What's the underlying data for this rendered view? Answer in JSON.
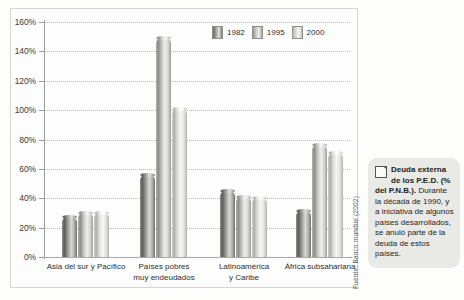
{
  "chart_data": {
    "type": "bar",
    "title": "",
    "xlabel": "",
    "ylabel": "",
    "ylim": [
      0,
      160
    ],
    "ytick_labels": [
      "0%",
      "20%",
      "40%",
      "60%",
      "80%",
      "100%",
      "120%",
      "140%",
      "160%"
    ],
    "ytick_values": [
      0,
      20,
      40,
      60,
      80,
      100,
      120,
      140,
      160
    ],
    "grid": true,
    "legend_position": "top-right",
    "categories": [
      "Asia del sur y Pacífico",
      "Países pobres\nmuy endeudados",
      "Latinoamérica\ny Caribe",
      "África subsahariana"
    ],
    "series": [
      {
        "name": "1982",
        "values": [
          27,
          56,
          45,
          31
        ]
      },
      {
        "name": "1995",
        "values": [
          30,
          149,
          41,
          76
        ]
      },
      {
        "name": "2000",
        "values": [
          30,
          101,
          40,
          71
        ]
      }
    ]
  },
  "legend": {
    "items": [
      {
        "label": "1982"
      },
      {
        "label": "1995"
      },
      {
        "label": "2000"
      }
    ]
  },
  "source": {
    "text": "Fuente: Banco mundial (2002)"
  },
  "callout": {
    "icon": "note-icon",
    "title": "Deuda externa de los P.E.D. (% del P.N.B.).",
    "body": " Durante la década de 1990, y a iniciativa de algunos países desarrollados, se anuló parte de la deuda de estos países."
  }
}
